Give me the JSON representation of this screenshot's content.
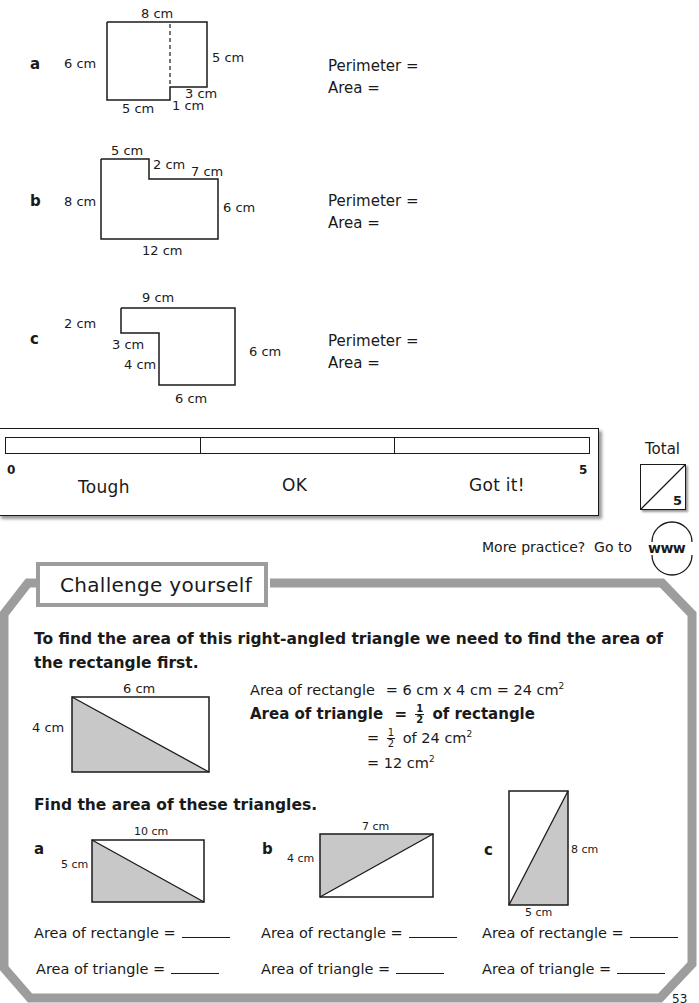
{
  "questions": [
    {
      "letter": "a",
      "labels": {
        "top": "8 cm",
        "left": "6 cm",
        "right": "5 cm",
        "bottom_left": "5 cm",
        "step_h": "3 cm",
        "step_v": "1 cm"
      },
      "perimeter_label": "Perimeter =",
      "area_label": "Area ="
    },
    {
      "letter": "b",
      "labels": {
        "top_left": "5 cm",
        "step_v": "2 cm",
        "top_right": "7 cm",
        "left": "8 cm",
        "right": "6 cm",
        "bottom": "12 cm"
      },
      "perimeter_label": "Perimeter =",
      "area_label": "Area ="
    },
    {
      "letter": "c",
      "labels": {
        "top": "9 cm",
        "left_top": "2 cm",
        "step_h": "3 cm",
        "step_v": "4 cm",
        "right": "6 cm",
        "bottom": "6 cm"
      },
      "perimeter_label": "Perimeter =",
      "area_label": "Area ="
    }
  ],
  "self_assessment": {
    "min": "0",
    "max": "5",
    "levels": [
      "Tough",
      "OK",
      "Got it!"
    ],
    "total_label": "Total",
    "total_out_of": "5"
  },
  "more_practice": {
    "text": "More practice?  Go to",
    "icon_label": "www"
  },
  "challenge": {
    "title": "Challenge yourself",
    "intro": "To find the area of this right-angled triangle we need to find the area of the rectangle first.",
    "example": {
      "width_label": "6 cm",
      "height_label": "4 cm",
      "line1_left": "Area of rectangle",
      "line1_right": "= 6 cm x 4 cm = 24 cm",
      "line2_left": "Area of triangle",
      "line2_eq": "=",
      "line2_right": "of rectangle",
      "line3_eq": "=",
      "line3_right": "of 24 cm",
      "line4": "= 12 cm",
      "frac_num": "1",
      "frac_den": "2",
      "sq": "2"
    },
    "task": "Find the area of these triangles.",
    "triangles": [
      {
        "letter": "a",
        "width_label": "10 cm",
        "height_label": "5 cm",
        "rect_label": "Area of rectangle =",
        "tri_label": "Area of triangle ="
      },
      {
        "letter": "b",
        "width_label": "7 cm",
        "height_label": "4 cm",
        "rect_label": "Area of rectangle =",
        "tri_label": "Area of triangle ="
      },
      {
        "letter": "c",
        "width_label": "5 cm",
        "height_label": "8 cm",
        "rect_label": "Area of rectangle =",
        "tri_label": "Area of triangle ="
      }
    ]
  },
  "page_number": "53",
  "colors": {
    "frame": "#9d9d9d",
    "shade": "#c8c8c8",
    "ink": "#1a1a1a"
  }
}
